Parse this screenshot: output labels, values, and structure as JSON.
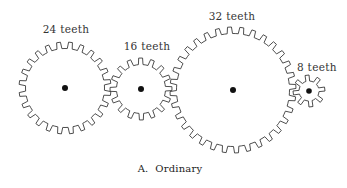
{
  "diagram": {
    "caption": "A.  Ordinary",
    "gears": [
      {
        "id": "gear-24",
        "label": "24 teeth",
        "teeth": 24
      },
      {
        "id": "gear-16",
        "label": "16 teeth",
        "teeth": 16
      },
      {
        "id": "gear-32",
        "label": "32 teeth",
        "teeth": 32
      },
      {
        "id": "gear-8",
        "label": "8 teeth",
        "teeth": 8
      }
    ]
  }
}
